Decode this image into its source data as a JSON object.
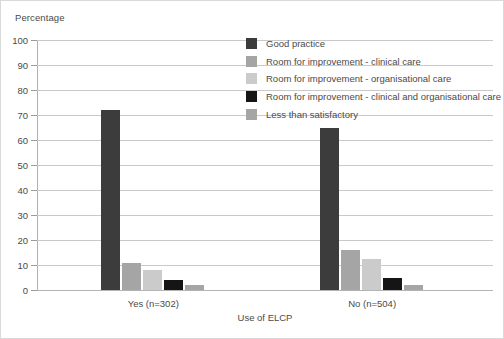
{
  "chart_data": {
    "type": "bar",
    "title": "",
    "ylabel": "Percentage",
    "xlabel": "Use of ELCP",
    "ylim": [
      0,
      100
    ],
    "ytick_labels": [
      "100",
      "90",
      "80",
      "70",
      "60",
      "50",
      "40",
      "30",
      "20",
      "10",
      "0"
    ],
    "ytick_values": [
      100,
      90,
      80,
      70,
      60,
      50,
      40,
      30,
      20,
      10,
      0
    ],
    "grid": true,
    "legend_position": "upper-center-right",
    "categories": [
      "Yes (n=302)",
      "No (n=504)"
    ],
    "series": [
      {
        "name": "Good practice",
        "color": "#3c3c3c",
        "values": [
          72,
          65
        ]
      },
      {
        "name": "Room for improvement - clinical care",
        "color": "#a5a5a5",
        "values": [
          11,
          16
        ]
      },
      {
        "name": "Room for improvement - organisational care",
        "color": "#cbcbcb",
        "values": [
          8,
          12.5
        ]
      },
      {
        "name": "Room for improvement - clinical and organisational care",
        "color": "#151515",
        "values": [
          4,
          5
        ]
      },
      {
        "name": "Less than satisfactory",
        "color": "#a5a5a5",
        "values": [
          2,
          2
        ]
      }
    ]
  }
}
